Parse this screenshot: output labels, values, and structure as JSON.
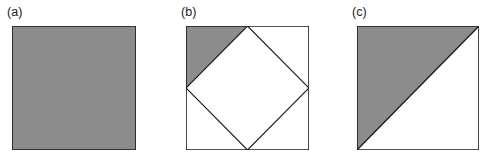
{
  "figure": {
    "background_color": "#ffffff",
    "shade_color": "#8c8c8c",
    "line_color": "#1a1a1a",
    "unshaded_color": "#ffffff",
    "panel_count": 3,
    "panels": [
      {
        "id": "a",
        "label": "(a)",
        "shape": "square",
        "description": "square fully shaded",
        "shaded_fraction": "1",
        "outline": [
          [
            0,
            0
          ],
          [
            100,
            0
          ],
          [
            100,
            100
          ],
          [
            0,
            100
          ]
        ],
        "shaded_regions": [
          {
            "name": "whole-square",
            "points": [
              [
                0,
                0
              ],
              [
                100,
                0
              ],
              [
                100,
                100
              ],
              [
                0,
                100
              ]
            ]
          }
        ],
        "interior_lines": []
      },
      {
        "id": "b",
        "label": "(b)",
        "shape": "square-with-inscribed-diamond",
        "description": "square with inscribed rotated square (diamond) whose vertices are the edge midpoints; only the top-left corner triangle is shaded",
        "shaded_fraction": "1/8",
        "outline": [
          [
            0,
            0
          ],
          [
            100,
            0
          ],
          [
            100,
            100
          ],
          [
            0,
            100
          ]
        ],
        "shaded_regions": [
          {
            "name": "top-left-corner-triangle",
            "points": [
              [
                0,
                0
              ],
              [
                50,
                0
              ],
              [
                0,
                50
              ]
            ]
          }
        ],
        "interior_lines": [
          {
            "name": "diamond",
            "points": [
              [
                50,
                0
              ],
              [
                100,
                50
              ],
              [
                50,
                100
              ],
              [
                0,
                50
              ]
            ]
          }
        ]
      },
      {
        "id": "c",
        "label": "(c)",
        "shape": "square-with-diagonal",
        "description": "square split by the anti-diagonal from bottom-left to top-right; the upper-left half is shaded",
        "shaded_fraction": "1/2",
        "outline": [
          [
            0,
            0
          ],
          [
            100,
            0
          ],
          [
            100,
            100
          ],
          [
            0,
            100
          ]
        ],
        "shaded_regions": [
          {
            "name": "upper-left-triangle",
            "points": [
              [
                0,
                0
              ],
              [
                100,
                0
              ],
              [
                0,
                100
              ]
            ]
          }
        ],
        "interior_lines": [
          {
            "name": "anti-diagonal",
            "points": [
              [
                100,
                0
              ],
              [
                0,
                100
              ]
            ]
          }
        ]
      }
    ]
  }
}
